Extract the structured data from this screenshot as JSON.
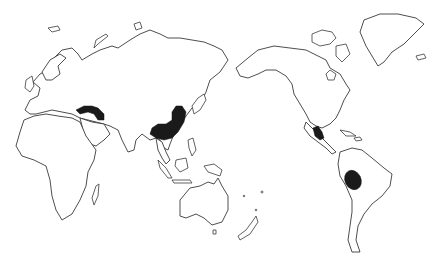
{
  "map": {
    "type": "world-outline",
    "projection": "Pacific-centered (Eurasia left, Americas right)",
    "background_color": "#ffffff",
    "outline_color": "#3a3a3a",
    "highlight_color": "#1a1a1a",
    "labels": [],
    "highlighted_regions": [
      {
        "id": "near-east",
        "name": "Near East (Anatolia / Fertile Crescent)",
        "approx_center_px": [
          95,
          112
        ]
      },
      {
        "id": "east-asia",
        "name": "East Asia (China)",
        "approx_center_px": [
          168,
          122
        ]
      },
      {
        "id": "mesoamerica",
        "name": "Mesoamerica (Mexico)",
        "approx_center_px": [
          316,
          136
        ]
      },
      {
        "id": "south-america",
        "name": "South America (Andes / Bolivia)",
        "approx_center_px": [
          353,
          180
        ]
      }
    ],
    "landmasses": [
      "Europe",
      "Africa",
      "Asia",
      "Australia",
      "New Zealand",
      "North America",
      "Greenland",
      "South America"
    ]
  }
}
